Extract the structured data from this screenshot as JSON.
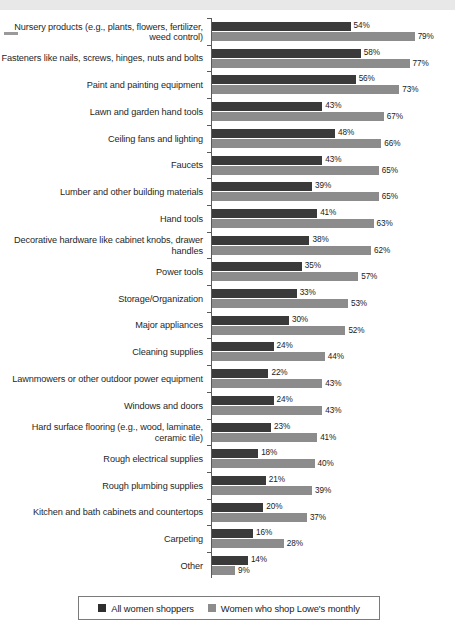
{
  "chart_data": {
    "type": "bar",
    "orientation": "horizontal",
    "title": "",
    "xlabel": "",
    "ylabel": "",
    "xlim": [
      0,
      90
    ],
    "grid": false,
    "legend_position": "bottom",
    "value_suffix": "%",
    "categories": [
      "Nursery products (e.g., plants, flowers, fertilizer, weed control)",
      "Fasteners like nails, screws, hinges, nuts and bolts",
      "Paint and painting equipment",
      "Lawn and garden hand tools",
      "Ceiling fans and lighting",
      "Faucets",
      "Lumber and other building materials",
      "Hand tools",
      "Decorative hardware like cabinet knobs, drawer handles",
      "Power tools",
      "Storage/Organization",
      "Major appliances",
      "Cleaning supplies",
      "Lawnmowers or other outdoor power equipment",
      "Windows and doors",
      "Hard surface flooring (e.g., wood, laminate, ceramic tile)",
      "Rough electrical supplies",
      "Rough plumbing supplies",
      "Kitchen and bath cabinets and countertops",
      "Carpeting",
      "Other"
    ],
    "series": [
      {
        "name": "All women shoppers",
        "color": "#3a3a3a",
        "values": [
          54,
          58,
          56,
          43,
          48,
          43,
          39,
          41,
          38,
          35,
          33,
          30,
          24,
          22,
          24,
          23,
          18,
          21,
          20,
          16,
          14
        ],
        "labels": [
          "54%",
          "58%",
          "56%",
          "43%",
          "48%",
          "43%",
          "39%",
          "41%",
          "38%",
          "35%",
          "33%",
          "30%",
          "24%",
          "22%",
          "24%",
          "23%",
          "18%",
          "21%",
          "20%",
          "16%",
          "14%"
        ]
      },
      {
        "name": "Women who shop Lowe's monthly",
        "color": "#8c8c8c",
        "values": [
          79,
          77,
          73,
          67,
          66,
          65,
          65,
          63,
          62,
          57,
          53,
          52,
          44,
          43,
          43,
          41,
          40,
          39,
          37,
          28,
          9
        ],
        "labels": [
          "79%",
          "77%",
          "73%",
          "67%",
          "66%",
          "65%",
          "65%",
          "63%",
          "62%",
          "57%",
          "53%",
          "52%",
          "44%",
          "43%",
          "43%",
          "41%",
          "40%",
          "39%",
          "37%",
          "28%",
          "9%"
        ]
      }
    ]
  },
  "legend": {
    "items": [
      {
        "label": "All women shoppers",
        "swatch": "a"
      },
      {
        "label": "Women who shop Lowe's monthly",
        "swatch": "b"
      }
    ]
  }
}
